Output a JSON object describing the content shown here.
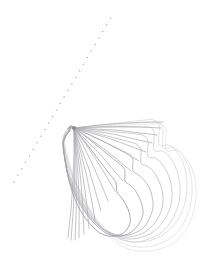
{
  "figure": {
    "title": "Contour Field Plot",
    "width": 207,
    "height": 271,
    "background_color": "#ffffff"
  },
  "colors": {
    "background": "#ffffff",
    "contour_outer": "#e2e2e4",
    "contour_mid": "#cfcfd2",
    "contour_inner": "#b4b4b8",
    "contour_core": "#9a9a9f",
    "ray_bundle": "#a9a9ae",
    "focus_point": "#8a8a90",
    "guide_dots": "#b0b0b6"
  },
  "focus_point": {
    "label": "contour-convergence-point",
    "x": 74,
    "y": 128
  },
  "guide_line": {
    "label": "dotted-reference-line",
    "style": "dotted",
    "x1": 14,
    "y1": 182,
    "x2": 113,
    "y2": 14,
    "dot_radius": 0.75,
    "dot_spacing": 7.6,
    "dot_count": 26
  },
  "chart_data": {
    "type": "line",
    "title": "Contour Field Plot",
    "xlabel": "",
    "ylabel": "",
    "grid": false,
    "legend": false,
    "xlim": [
      0,
      207
    ],
    "ylim": [
      0,
      271
    ],
    "plot_style": "contour",
    "level_count": 9,
    "annotations": [
      "focal convergence point at (74, 128)",
      "dotted straight guide line from lower-left to upper-right"
    ],
    "series": [
      {
        "name": "level-1-outermost",
        "stroke": "#e4e4e6",
        "width": 0.8,
        "closed": true,
        "points": [
          [
            74,
            128
          ],
          [
            150,
            124
          ],
          [
            159,
            124
          ],
          [
            166,
            129
          ],
          [
            166,
            150
          ],
          [
            176,
            150
          ],
          [
            183,
            155
          ],
          [
            191,
            166
          ],
          [
            195,
            180
          ],
          [
            196,
            196
          ],
          [
            193,
            214
          ],
          [
            186,
            230
          ],
          [
            176,
            241
          ],
          [
            163,
            248
          ],
          [
            148,
            251
          ],
          [
            132,
            250
          ],
          [
            118,
            244
          ],
          [
            106,
            234
          ],
          [
            96,
            221
          ],
          [
            86,
            205
          ],
          [
            78,
            188
          ],
          [
            72,
            172
          ],
          [
            68,
            158
          ],
          [
            66,
            148
          ],
          [
            64,
            140
          ],
          [
            64,
            134
          ],
          [
            68,
            130
          ]
        ]
      },
      {
        "name": "level-2",
        "stroke": "#e0e0e3",
        "width": 0.8,
        "closed": true,
        "points": [
          [
            74,
            128
          ],
          [
            148,
            122
          ],
          [
            157,
            122
          ],
          [
            163,
            127
          ],
          [
            163,
            147
          ],
          [
            173,
            147
          ],
          [
            180,
            152
          ],
          [
            187,
            163
          ],
          [
            191,
            177
          ],
          [
            192,
            193
          ],
          [
            189,
            210
          ],
          [
            182,
            226
          ],
          [
            172,
            237
          ],
          [
            159,
            244
          ],
          [
            145,
            247
          ],
          [
            130,
            246
          ],
          [
            116,
            240
          ],
          [
            104,
            230
          ],
          [
            94,
            217
          ],
          [
            85,
            202
          ],
          [
            77,
            186
          ],
          [
            71,
            170
          ],
          [
            67,
            157
          ],
          [
            65,
            147
          ],
          [
            64,
            139
          ],
          [
            65,
            133
          ],
          [
            69,
            129
          ]
        ]
      },
      {
        "name": "level-3",
        "stroke": "#dadadd",
        "width": 0.8,
        "closed": true,
        "points": [
          [
            74,
            128
          ],
          [
            145,
            120
          ],
          [
            153,
            120
          ],
          [
            159,
            125
          ],
          [
            159,
            145
          ],
          [
            168,
            145
          ],
          [
            175,
            150
          ],
          [
            182,
            160
          ],
          [
            186,
            174
          ],
          [
            187,
            190
          ],
          [
            184,
            206
          ],
          [
            177,
            221
          ],
          [
            167,
            232
          ],
          [
            155,
            239
          ],
          [
            141,
            242
          ],
          [
            127,
            241
          ],
          [
            114,
            235
          ],
          [
            102,
            225
          ],
          [
            92,
            213
          ],
          [
            84,
            198
          ],
          [
            76,
            183
          ],
          [
            70,
            168
          ],
          [
            66,
            155
          ],
          [
            64,
            146
          ],
          [
            63,
            139
          ],
          [
            65,
            133
          ],
          [
            69,
            129
          ]
        ]
      },
      {
        "name": "level-4",
        "stroke": "#d2d2d6",
        "width": 0.85,
        "closed": true,
        "points": [
          [
            74,
            128
          ],
          [
            141,
            127
          ],
          [
            149,
            127
          ],
          [
            154,
            132
          ],
          [
            154,
            150
          ],
          [
            162,
            151
          ],
          [
            169,
            156
          ],
          [
            175,
            166
          ],
          [
            179,
            179
          ],
          [
            180,
            194
          ],
          [
            177,
            209
          ],
          [
            170,
            223
          ],
          [
            161,
            233
          ],
          [
            149,
            239
          ],
          [
            136,
            242
          ],
          [
            123,
            240
          ],
          [
            110,
            234
          ],
          [
            99,
            224
          ],
          [
            90,
            212
          ],
          [
            82,
            198
          ],
          [
            75,
            183
          ],
          [
            69,
            168
          ],
          [
            66,
            156
          ],
          [
            64,
            147
          ],
          [
            63,
            140
          ],
          [
            65,
            134
          ],
          [
            69,
            130
          ]
        ]
      },
      {
        "name": "level-5",
        "stroke": "#c8c8cc",
        "width": 0.85,
        "closed": true,
        "points": [
          [
            74,
            128
          ],
          [
            136,
            134
          ],
          [
            144,
            136
          ],
          [
            148,
            141
          ],
          [
            148,
            156
          ],
          [
            155,
            158
          ],
          [
            161,
            163
          ],
          [
            167,
            172
          ],
          [
            171,
            184
          ],
          [
            172,
            197
          ],
          [
            169,
            211
          ],
          [
            162,
            223
          ],
          [
            153,
            232
          ],
          [
            142,
            237
          ],
          [
            130,
            239
          ],
          [
            118,
            237
          ],
          [
            106,
            231
          ],
          [
            96,
            222
          ],
          [
            87,
            210
          ],
          [
            80,
            197
          ],
          [
            73,
            183
          ],
          [
            68,
            169
          ],
          [
            65,
            157
          ],
          [
            64,
            148
          ],
          [
            63,
            141
          ],
          [
            65,
            135
          ],
          [
            69,
            130
          ]
        ]
      },
      {
        "name": "level-6",
        "stroke": "#bebec3",
        "width": 0.85,
        "closed": true,
        "points": [
          [
            74,
            128
          ],
          [
            130,
            142
          ],
          [
            137,
            145
          ],
          [
            141,
            150
          ],
          [
            141,
            163
          ],
          [
            147,
            166
          ],
          [
            153,
            171
          ],
          [
            158,
            179
          ],
          [
            162,
            190
          ],
          [
            163,
            202
          ],
          [
            160,
            214
          ],
          [
            154,
            224
          ],
          [
            145,
            232
          ],
          [
            135,
            236
          ],
          [
            124,
            237
          ],
          [
            113,
            234
          ],
          [
            102,
            228
          ],
          [
            93,
            219
          ],
          [
            85,
            208
          ],
          [
            78,
            196
          ],
          [
            72,
            183
          ],
          [
            67,
            170
          ],
          [
            65,
            158
          ],
          [
            64,
            149
          ],
          [
            63,
            142
          ],
          [
            65,
            136
          ],
          [
            69,
            131
          ]
        ]
      },
      {
        "name": "level-7",
        "stroke": "#b2b2b8",
        "width": 0.85,
        "closed": true,
        "points": [
          [
            74,
            128
          ],
          [
            123,
            151
          ],
          [
            130,
            155
          ],
          [
            133,
            160
          ],
          [
            133,
            171
          ],
          [
            139,
            175
          ],
          [
            144,
            180
          ],
          [
            149,
            187
          ],
          [
            152,
            196
          ],
          [
            153,
            207
          ],
          [
            150,
            217
          ],
          [
            145,
            226
          ],
          [
            137,
            232
          ],
          [
            128,
            235
          ],
          [
            118,
            235
          ],
          [
            108,
            232
          ],
          [
            99,
            226
          ],
          [
            90,
            217
          ],
          [
            83,
            207
          ],
          [
            76,
            195
          ],
          [
            71,
            183
          ],
          [
            67,
            171
          ],
          [
            65,
            159
          ],
          [
            64,
            150
          ],
          [
            63,
            143
          ],
          [
            65,
            137
          ],
          [
            69,
            131
          ]
        ]
      },
      {
        "name": "level-8",
        "stroke": "#a8a8ae",
        "width": 0.85,
        "closed": true,
        "points": [
          [
            74,
            128
          ],
          [
            116,
            161
          ],
          [
            122,
            166
          ],
          [
            125,
            171
          ],
          [
            125,
            181
          ],
          [
            130,
            185
          ],
          [
            135,
            190
          ],
          [
            139,
            197
          ],
          [
            142,
            205
          ],
          [
            143,
            214
          ],
          [
            140,
            222
          ],
          [
            135,
            229
          ],
          [
            128,
            234
          ],
          [
            120,
            236
          ],
          [
            111,
            235
          ],
          [
            103,
            231
          ],
          [
            95,
            224
          ],
          [
            88,
            216
          ],
          [
            81,
            206
          ],
          [
            75,
            195
          ],
          [
            70,
            183
          ],
          [
            67,
            172
          ],
          [
            65,
            161
          ],
          [
            64,
            152
          ],
          [
            63,
            144
          ],
          [
            65,
            138
          ],
          [
            69,
            132
          ]
        ]
      },
      {
        "name": "level-9-innermost",
        "stroke": "#9c9ca2",
        "width": 0.85,
        "closed": true,
        "points": [
          [
            74,
            128
          ],
          [
            108,
            172
          ],
          [
            113,
            178
          ],
          [
            116,
            183
          ],
          [
            117,
            192
          ],
          [
            121,
            197
          ],
          [
            125,
            203
          ],
          [
            128,
            209
          ],
          [
            130,
            216
          ],
          [
            130,
            223
          ],
          [
            127,
            229
          ],
          [
            122,
            234
          ],
          [
            115,
            236
          ],
          [
            108,
            236
          ],
          [
            100,
            233
          ],
          [
            93,
            227
          ],
          [
            86,
            219
          ],
          [
            80,
            210
          ],
          [
            75,
            199
          ],
          [
            71,
            188
          ],
          [
            68,
            176
          ],
          [
            66,
            165
          ],
          [
            64,
            155
          ],
          [
            63,
            147
          ],
          [
            64,
            140
          ],
          [
            66,
            135
          ],
          [
            70,
            131
          ]
        ]
      }
    ],
    "ray_bundle": {
      "name": "converging-ray-bundle",
      "origin": [
        74,
        128
      ],
      "stroke": "#a9a9ae",
      "width": 0.7,
      "count": 18,
      "endpoints": [
        [
          163,
          122
        ],
        [
          161,
          128
        ],
        [
          157,
          135
        ],
        [
          152,
          143
        ],
        [
          146,
          152
        ],
        [
          139,
          161
        ],
        [
          131,
          171
        ],
        [
          123,
          181
        ],
        [
          115,
          191
        ],
        [
          108,
          201
        ],
        [
          101,
          211
        ],
        [
          95,
          220
        ],
        [
          89,
          228
        ],
        [
          84,
          234
        ],
        [
          79,
          238
        ],
        [
          75,
          240
        ],
        [
          71,
          240
        ],
        [
          68,
          238
        ]
      ]
    }
  }
}
